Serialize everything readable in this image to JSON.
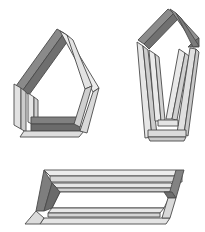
{
  "page": {
    "width": 205,
    "height": 232,
    "background_color": "#ffffff"
  },
  "palette": {
    "background": "#ffffff",
    "beam_light_top": "#e9e9e9",
    "beam_light_face": "#d6d6d6",
    "beam_light_side": "#c3c3c3",
    "beam_dark_top": "#8a8a8a",
    "beam_dark_face": "#727272",
    "beam_dark_side": "#5f5f5f",
    "outline": "#4a4a4a",
    "interior": "#ffffff"
  },
  "figures": [
    {
      "id": "pentagon-frame",
      "label": "Pentagon beam frame",
      "position": "top-left",
      "shading": "dark upper-left beam, dark bottom beam, light right and left beams"
    },
    {
      "id": "elongated-pentagon-frame",
      "label": "Elongated pentagon beam frame",
      "position": "top-right",
      "shading": "dark chevron apex, four long light beams, light crossing beams at base"
    },
    {
      "id": "parallelogram-frame",
      "label": "Flat parallelogram beam frame",
      "position": "bottom",
      "shading": "light top and bottom rails, dark end posts, white interior"
    }
  ],
  "figure1": {
    "name": "pentagon-frame",
    "beams": [
      {
        "name": "upper-left-dark-beam",
        "tone": "dark"
      },
      {
        "name": "left-light-beam-outer",
        "tone": "light"
      },
      {
        "name": "left-light-beam-inner",
        "tone": "light"
      },
      {
        "name": "bottom-dark-beam",
        "tone": "dark"
      },
      {
        "name": "bottom-light-beam",
        "tone": "light"
      },
      {
        "name": "right-light-beam-outer",
        "tone": "light"
      },
      {
        "name": "right-light-beam-inner",
        "tone": "light"
      }
    ]
  },
  "figure2": {
    "name": "elongated-pentagon-frame",
    "beams": [
      {
        "name": "apex-dark-beam-left",
        "tone": "dark"
      },
      {
        "name": "apex-dark-beam-right",
        "tone": "dark"
      },
      {
        "name": "left-long-beam-outer",
        "tone": "light"
      },
      {
        "name": "left-long-beam-inner",
        "tone": "light"
      },
      {
        "name": "right-long-beam-outer",
        "tone": "light"
      },
      {
        "name": "right-long-beam-inner",
        "tone": "light"
      },
      {
        "name": "base-cross-beam-upper",
        "tone": "light"
      },
      {
        "name": "base-cross-beam-lower",
        "tone": "light"
      }
    ]
  },
  "figure3": {
    "name": "parallelogram-frame",
    "beams": [
      {
        "name": "top-rail-light-beam",
        "tone": "light"
      },
      {
        "name": "inner-top-rail-light-beam",
        "tone": "light"
      },
      {
        "name": "left-post-dark-beam",
        "tone": "dark"
      },
      {
        "name": "right-post-dark-beam",
        "tone": "dark"
      },
      {
        "name": "bottom-rail-light-beam",
        "tone": "light"
      },
      {
        "name": "inner-bottom-rail-light-beam",
        "tone": "light"
      }
    ]
  }
}
